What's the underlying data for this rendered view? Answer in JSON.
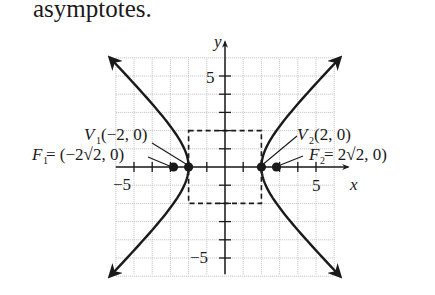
{
  "text": {
    "heading": "asymptotes."
  },
  "chart_data": {
    "type": "line",
    "xlabel": "x",
    "ylabel": "y",
    "xlim": [
      -6,
      6
    ],
    "ylim": [
      -6,
      6
    ],
    "grid": true,
    "ticks": {
      "x": [
        -5,
        5
      ],
      "y": [
        5,
        -5
      ]
    },
    "tick_labels": {
      "x_neg": "−5",
      "x_pos": "5",
      "y_pos": "5",
      "y_neg": "−5"
    },
    "asymptote_box": {
      "x": [
        -2,
        2
      ],
      "y": [
        -2,
        2
      ],
      "style": "dashed"
    },
    "branches": [
      {
        "name": "left branch",
        "x_vertex": -2,
        "opens": "left"
      },
      {
        "name": "right branch",
        "x_vertex": 2,
        "opens": "right"
      }
    ],
    "points": [
      {
        "name": "V1",
        "x": -2,
        "y": 0
      },
      {
        "name": "V2",
        "x": 2,
        "y": 0
      },
      {
        "name": "F1",
        "x": -2.828,
        "y": 0
      },
      {
        "name": "F2",
        "x": 2.828,
        "y": 0
      }
    ],
    "annotations": {
      "v1_label_main": "V",
      "v1_label_sub": "1",
      "v1_label_rest": "(−2, 0)",
      "v2_label_main": "V",
      "v2_label_sub": "2",
      "v2_label_rest": "(2, 0)",
      "f1_label_main": "F",
      "f1_label_sub": "1",
      "f1_label_rest": " = (−2√2, 0)",
      "f2_label_main": "F",
      "f2_label_sub": "2",
      "f2_label_rest": " = 2√2, 0)"
    }
  }
}
